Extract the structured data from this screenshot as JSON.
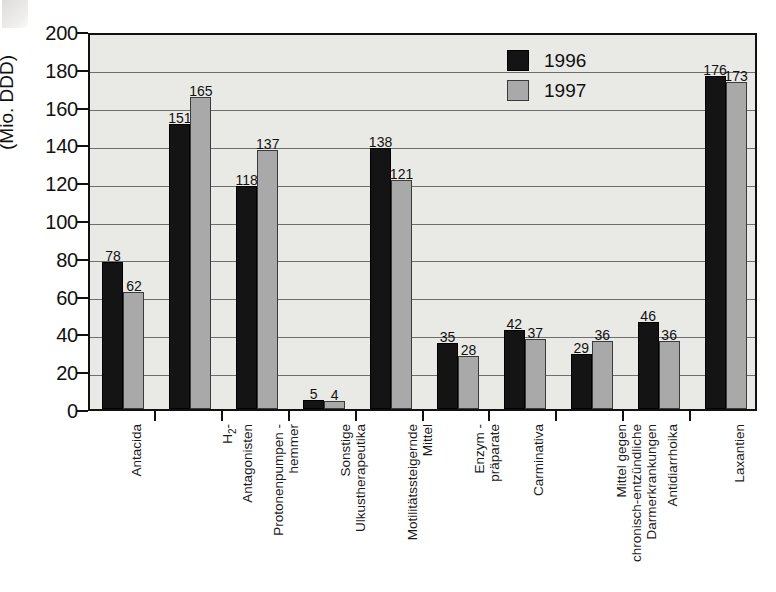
{
  "chart_data": {
    "type": "bar",
    "title": "",
    "subtitle": "",
    "xlabel": "",
    "ylabel": "(Mio. DDD)",
    "ylim": [
      0,
      200
    ],
    "ytick_step": 20,
    "yticks": [
      0,
      20,
      40,
      60,
      80,
      100,
      120,
      140,
      160,
      180,
      200
    ],
    "grid": true,
    "legend_position": "top-right",
    "categories": [
      "Antacida",
      "H2-Antagonisten",
      "Protonenpumpen-hemmer",
      "Sonstige Ulkustherapeutika",
      "Motilitätssteigernde Mittel",
      "Enzym-präparate",
      "Carminativa",
      "Mittel gegen chronisch-entzündliche Darmerkrankungen",
      "Antidiarrhoika",
      "Laxantien"
    ],
    "category_label_lines": [
      [
        "Antacida"
      ],
      [
        "H",
        "2",
        "-",
        "Antagonisten"
      ],
      [
        "Protonenpumpen -",
        "hemmer"
      ],
      [
        "Sonstige",
        "Ulkustherapeutika"
      ],
      [
        "Motilitätssteigernde",
        "Mittel"
      ],
      [
        "Enzym -",
        "präparate"
      ],
      [
        "Carminativa"
      ],
      [
        "Mittel gegen",
        "chronisch-entzündliche",
        "Darmerkrankungen"
      ],
      [
        "Antidiarrhoika"
      ],
      [
        "Laxantien"
      ]
    ],
    "series": [
      {
        "name": "1996",
        "color": "#141414",
        "values": [
          78,
          151,
          118,
          5,
          138,
          35,
          42,
          29,
          46,
          176
        ]
      },
      {
        "name": "1997",
        "color": "#a9a9a9",
        "values": [
          62,
          165,
          137,
          4,
          121,
          28,
          37,
          36,
          36,
          173
        ]
      }
    ]
  },
  "legend": {
    "items": [
      {
        "label": "1996",
        "swatch": "black-square-swatch"
      },
      {
        "label": "1997",
        "swatch": "gray-square-swatch"
      }
    ]
  },
  "axis": {
    "y_title": "(Mio. DDD)"
  }
}
